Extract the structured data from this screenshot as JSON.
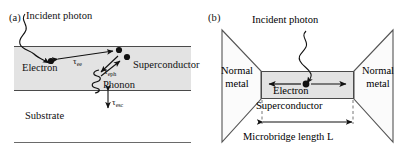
{
  "figure": {
    "type": "physics-schematic",
    "width": 410,
    "height": 162,
    "background_color": "#ffffff"
  },
  "panels": {
    "a": {
      "label": "(a)",
      "incident_photon_label": "Incident photon",
      "layers": [
        {
          "name": "superconductor",
          "label": "Superconductor",
          "fill_color": "#e3e3e3",
          "border_color": "#4a4a4a"
        },
        {
          "name": "substrate",
          "label": "Substrate",
          "fill_color": "#ffffff",
          "border_color": "#6a6a6a"
        }
      ],
      "particles": {
        "electron_label": "Electron",
        "phonon_label": "Phonon",
        "electron_dot_color": "#111111"
      },
      "time_constants": [
        {
          "name": "tau-ee",
          "symbol": "τ",
          "subscript": "ee",
          "meaning": "electron-electron interaction time"
        },
        {
          "name": "tau-eph",
          "symbol": "τ",
          "subscript": "eph",
          "meaning": "electron-phonon interaction time"
        },
        {
          "name": "tau-esc",
          "symbol": "τ",
          "subscript": "esc",
          "meaning": "phonon escape time to substrate"
        }
      ]
    },
    "b": {
      "label": "(b)",
      "incident_photon_label": "Incident photon",
      "normal_metal_left_line1": "Normal",
      "normal_metal_left_line2": "metal",
      "normal_metal_right_line1": "Normal",
      "normal_metal_right_line2": "metal",
      "bridge": {
        "name": "microbridge",
        "superconductor_label": "Superconductor",
        "electron_label": "Electron",
        "fill_color": "#e3e3e3",
        "border_color": "#4a4a4a"
      },
      "dimension_label": "Microbridge length L"
    }
  }
}
